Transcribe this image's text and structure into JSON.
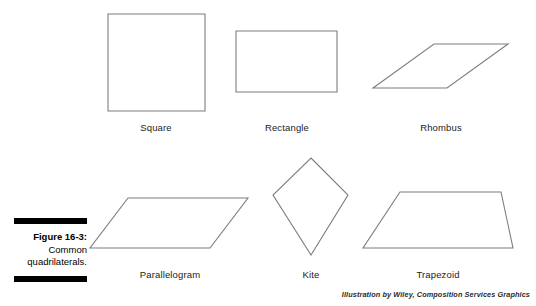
{
  "figure": {
    "caption_label": "Figure 16-3:",
    "caption_line2": "Common",
    "caption_line3": "quadrilaterals.",
    "credit": "Illustration by Wiley, Composition Services Graphics",
    "stroke_color": "#7d7d7d",
    "rule_color": "#000000",
    "background": "#ffffff"
  },
  "shapes": [
    {
      "name": "square",
      "label": "Square",
      "label_x": 156,
      "label_y": 122,
      "points": "108,14 205,14 205,111 108,111"
    },
    {
      "name": "rectangle",
      "label": "Rectangle",
      "label_x": 287,
      "label_y": 122,
      "points": "236,31 337,31 337,92 236,92"
    },
    {
      "name": "rhombus",
      "label": "Rhombus",
      "label_x": 441,
      "label_y": 122,
      "points": "434,44 508,44 447,88 373,88"
    },
    {
      "name": "parallelogram",
      "label": "Parallelogram",
      "label_x": 170,
      "label_y": 269,
      "points": "128,198 248,198 210,248 90,248"
    },
    {
      "name": "kite",
      "label": "Kite",
      "label_x": 311,
      "label_y": 269,
      "points": "311,158 348,195 311,255 273,195"
    },
    {
      "name": "trapezoid",
      "label": "Trapezoid",
      "label_x": 438,
      "label_y": 269,
      "points": "400,192 501,192 513,248 363,248"
    }
  ]
}
